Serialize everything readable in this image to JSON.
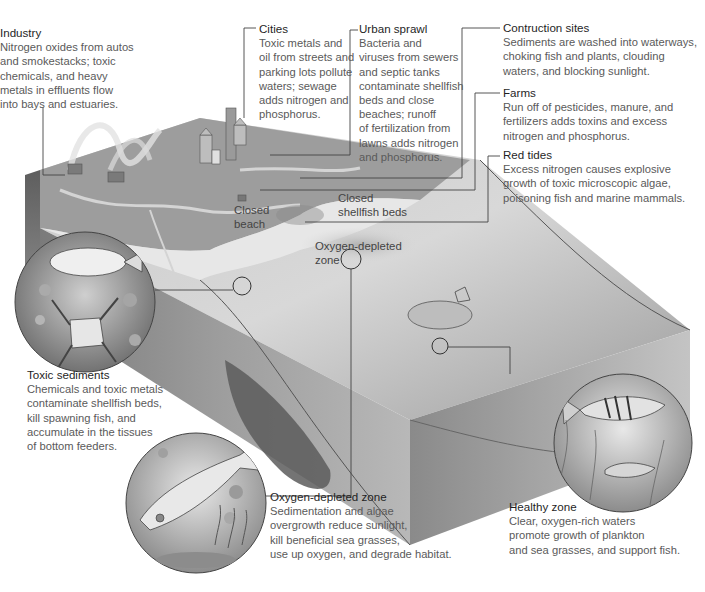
{
  "diagram": {
    "colors": {
      "background": "#ffffff",
      "text_title": "#1f1f1f",
      "text_body": "#5a5a5a",
      "leader_line": "#444444",
      "block_top": "#bcbcbc",
      "block_side": "#8a8a8a",
      "land": "#9a9a9a"
    }
  },
  "callouts": {
    "industry": {
      "title": "Industry",
      "lines": [
        "Nitrogen oxides from autos",
        "and smokestacks; toxic",
        "chemicals, and heavy",
        "metals in effluents flow",
        "into bays and estuaries."
      ]
    },
    "cities": {
      "title": "Cities",
      "lines": [
        "Toxic metals and",
        "oil from streets and",
        "parking lots pollute",
        "waters; sewage",
        "adds nitrogen and",
        "phosphorus."
      ]
    },
    "urban_sprawl": {
      "title": "Urban sprawl",
      "lines": [
        "Bacteria and",
        "viruses from sewers",
        "and septic tanks",
        "contaminate shellfish",
        "beds and close",
        "beaches; runoff",
        "of fertilization from",
        "lawns adds nitrogen",
        "and phosphorus."
      ]
    },
    "construction": {
      "title": "Contruction sites",
      "lines": [
        "Sediments are washed into waterways,",
        "choking fish and plants, clouding",
        "waters, and blocking sunlight."
      ]
    },
    "farms": {
      "title": "Farms",
      "lines": [
        "Run off of pesticides, manure, and",
        "fertilizers adds toxins and excess",
        "nitrogen and phosphorus."
      ]
    },
    "red_tides": {
      "title": "Red tides",
      "lines": [
        "Excess nitrogen causes explosive",
        "growth of toxic microscopic algae,",
        "poisoning fish and marine mammals."
      ]
    },
    "toxic_sediments": {
      "title": "Toxic sediments",
      "lines": [
        "Chemicals and toxic metals",
        "contaminate shellfish beds,",
        "kill spawning fish, and",
        "accumulate in the tissues",
        "of bottom feeders."
      ]
    },
    "oxygen_depleted": {
      "title": "Oxygen-depleted zone",
      "lines": [
        "Sedimentation and algae",
        "overgrowth reduce sunlight,",
        "kill beneficial sea grasses,",
        "use up oxygen, and degrade habitat."
      ]
    },
    "healthy_zone": {
      "title": "Healthy zone",
      "lines": [
        "Clear, oxygen-rich waters",
        "promote growth of plankton",
        "and sea grasses, and support fish."
      ]
    }
  },
  "map_labels": {
    "closed_beach": [
      "Closed",
      "beach"
    ],
    "closed_shellfish": [
      "Closed",
      "shellfish beds"
    ],
    "oxygen_zone": [
      "Oxygen-depleted",
      "zone"
    ]
  },
  "icons": {
    "toxic_sediments_inset": "flounder-crab-icon",
    "oxygen_depleted_inset": "fish-seagrass-icon",
    "healthy_zone_inset": "striped-fish-icon"
  }
}
